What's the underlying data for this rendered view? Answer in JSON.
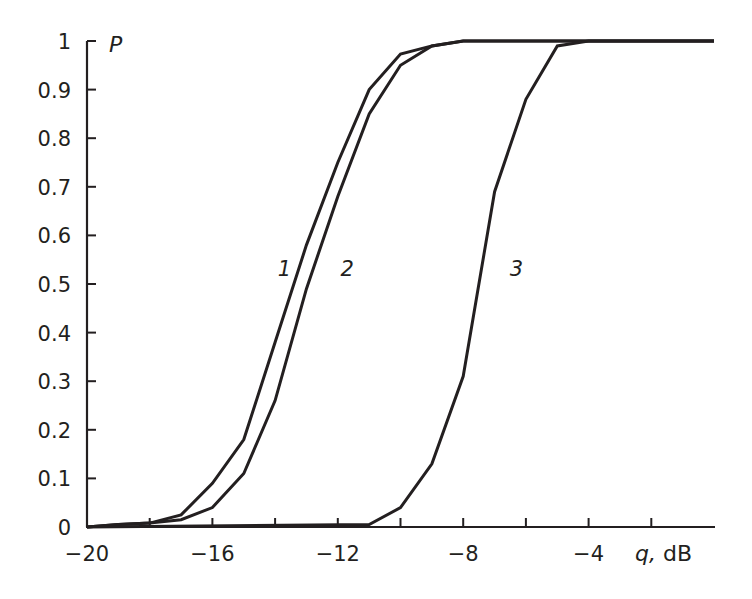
{
  "chart_data": {
    "type": "line",
    "title": "",
    "xlabel": "q, dB",
    "xlabel_var": "q,",
    "xlabel_unit": " dB",
    "ylabel": "P",
    "xlim": [
      -20,
      0
    ],
    "ylim": [
      0,
      1
    ],
    "grid": false,
    "legend": "inline curve labels",
    "x_ticks": [
      -20,
      -18,
      -16,
      -14,
      -12,
      -10,
      -8,
      -6,
      -4,
      -2
    ],
    "x_tick_labels": [
      {
        "value": -20,
        "label": "−20"
      },
      {
        "value": -16,
        "label": "−16"
      },
      {
        "value": -12,
        "label": "−12"
      },
      {
        "value": -8,
        "label": "−8"
      },
      {
        "value": -4,
        "label": "−4"
      }
    ],
    "y_ticks": [
      0,
      0.1,
      0.2,
      0.3,
      0.4,
      0.5,
      0.6,
      0.7,
      0.8,
      0.9,
      1
    ],
    "y_tick_labels": [
      "0",
      "0.1",
      "0.2",
      "0.3",
      "0.4",
      "0.5",
      "0.6",
      "0.7",
      "0.8",
      "0.9",
      "1"
    ],
    "series": [
      {
        "name": "1",
        "label_pos": {
          "x": -13.7,
          "y": 0.53
        },
        "x": [
          -20,
          -19,
          -18,
          -17,
          -16,
          -15,
          -14,
          -13,
          -12,
          -11,
          -10,
          -9,
          -8,
          0
        ],
        "values": [
          0,
          0.005,
          0.008,
          0.025,
          0.09,
          0.18,
          0.38,
          0.58,
          0.75,
          0.9,
          0.973,
          0.99,
          1,
          1
        ]
      },
      {
        "name": "2",
        "label_pos": {
          "x": -11.7,
          "y": 0.53
        },
        "x": [
          -20,
          -19,
          -18,
          -17,
          -16,
          -15,
          -14,
          -13,
          -12,
          -11,
          -10,
          -9,
          -8,
          0
        ],
        "values": [
          0,
          0.005,
          0.008,
          0.015,
          0.04,
          0.11,
          0.26,
          0.49,
          0.68,
          0.85,
          0.95,
          0.99,
          1,
          1
        ]
      },
      {
        "name": "3",
        "label_pos": {
          "x": -6.3,
          "y": 0.53
        },
        "x": [
          -20,
          -11,
          -10,
          -9,
          -8,
          -7,
          -6,
          -5,
          -4,
          0
        ],
        "values": [
          0,
          0.005,
          0.04,
          0.13,
          0.31,
          0.69,
          0.88,
          0.99,
          1,
          1
        ]
      }
    ]
  }
}
